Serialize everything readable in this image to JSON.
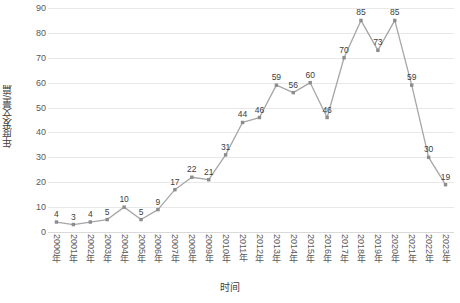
{
  "chart_data": {
    "type": "line",
    "title": "",
    "xlabel": "时间",
    "ylabel": "年度发文量/篇",
    "categories": [
      "2000年",
      "2001年",
      "2002年",
      "2003年",
      "2004年",
      "2005年",
      "2006年",
      "2007年",
      "2008年",
      "2009年",
      "2010年",
      "2011年",
      "2012年",
      "2013年",
      "2014年",
      "2015年",
      "2016年",
      "2017年",
      "2018年",
      "2019年",
      "2020年",
      "2021年",
      "2022年",
      "2023年"
    ],
    "values": [
      4,
      3,
      4,
      5,
      10,
      5,
      9,
      17,
      22,
      21,
      31,
      44,
      46,
      59,
      56,
      60,
      46,
      70,
      85,
      73,
      85,
      59,
      30,
      19
    ],
    "ylim": [
      0,
      90
    ],
    "ytick_labels": [
      "0",
      "10",
      "20",
      "30",
      "40",
      "50",
      "60",
      "70",
      "80",
      "90"
    ],
    "ytick_values": [
      0,
      10,
      20,
      30,
      40,
      50,
      60,
      70,
      80,
      90
    ],
    "grid": true,
    "legend": "none",
    "show_data_labels": true,
    "series_color": "#a6a6a6",
    "marker_color": "#8c8c8c",
    "gridline_color": "#e8e8e8",
    "label_color": "#404040",
    "axis_text_color": "#595959"
  }
}
